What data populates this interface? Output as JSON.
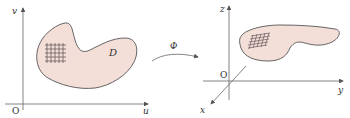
{
  "diagram": {
    "left_panel": {
      "axes": {
        "x_label": "u",
        "y_label": "v",
        "origin_label": "O"
      },
      "region_label": "D",
      "grid": {
        "rows": 5,
        "cols": 5
      }
    },
    "mapping": {
      "label": "Φ"
    },
    "right_panel": {
      "axes": {
        "x_label": "x",
        "y_label": "y",
        "z_label": "z",
        "origin_label": "O"
      },
      "grid": {
        "rows": 5,
        "cols": 5
      }
    },
    "colors": {
      "region_fill": "#f3dfd8",
      "region_stroke": "#555555",
      "grid": "#6b5a60",
      "axis": "#555555"
    }
  }
}
